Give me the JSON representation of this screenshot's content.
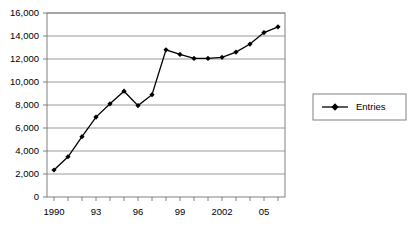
{
  "chart_data": {
    "type": "line",
    "title": "",
    "xlabel": "",
    "ylabel": "",
    "x": [
      1990,
      1991,
      1992,
      1993,
      1994,
      1995,
      1996,
      1997,
      1998,
      1999,
      2000,
      2001,
      2002,
      2003,
      2004,
      2005,
      2006
    ],
    "categories": [
      "1990",
      "1991",
      "1992",
      "1993",
      "1994",
      "1995",
      "1996",
      "1997",
      "1998",
      "1999",
      "2000",
      "2001",
      "2002",
      "2003",
      "2004",
      "2005",
      "2006"
    ],
    "series": [
      {
        "name": "Entries",
        "values": [
          2350,
          3500,
          5250,
          6950,
          8100,
          9200,
          7950,
          8900,
          12800,
          12400,
          12050,
          12050,
          12150,
          12600,
          13300,
          14300,
          14800
        ],
        "marker": "diamond",
        "color": "#000000"
      }
    ],
    "xlim": [
      1989.5,
      2006.5
    ],
    "ylim": [
      0,
      16000
    ],
    "ytick_values": [
      0,
      2000,
      4000,
      6000,
      8000,
      10000,
      12000,
      14000,
      16000
    ],
    "ytick_labels": [
      "0",
      "2,000",
      "4,000",
      "6,000",
      "8,000",
      "10,000",
      "12,000",
      "14,000",
      "16,000"
    ],
    "xtick_values": [
      1990,
      1991,
      1992,
      1993,
      1994,
      1995,
      1996,
      1997,
      1998,
      1999,
      2000,
      2001,
      2002,
      2003,
      2004,
      2005,
      2006
    ],
    "xtick_labels": [
      "1990",
      "",
      "",
      "93",
      "",
      "",
      "96",
      "",
      "",
      "99",
      "",
      "",
      "2002",
      "",
      "",
      "05",
      ""
    ],
    "grid": "horizontal",
    "legend": {
      "position": "right",
      "entries": [
        "Entries"
      ],
      "border_color": "#808080"
    },
    "axis_color": "#808080",
    "gridline_color": "#9a9a9a",
    "plot_background": "#ffffff"
  },
  "legend": {
    "entry_label": "Entries"
  }
}
